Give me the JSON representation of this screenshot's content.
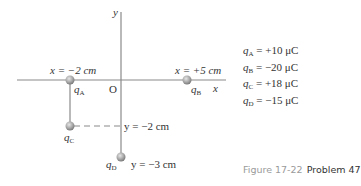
{
  "figure": {
    "caption_figure": "Figure 17-22",
    "caption_problem": "Problem 47"
  },
  "axes": {
    "x_label": "x",
    "y_label": "y",
    "origin_label": "O"
  },
  "points": {
    "qA": {
      "name": "q",
      "sub": "A",
      "position_label": "x = −2 cm"
    },
    "qB": {
      "name": "q",
      "sub": "B",
      "position_label": "x = +5 cm"
    },
    "qC": {
      "name": "q",
      "sub": "C",
      "position_label": "y = −2 cm"
    },
    "qD": {
      "name": "q",
      "sub": "D",
      "position_label": "y = −3 cm"
    }
  },
  "charges": [
    {
      "name": "q",
      "sub": "A",
      "value": " = +10 μC"
    },
    {
      "name": "q",
      "sub": "B",
      "value": " = −20 μC"
    },
    {
      "name": "q",
      "sub": "C",
      "value": " = +18 μC"
    },
    {
      "name": "q",
      "sub": "D",
      "value": " = −15 μC"
    }
  ],
  "colors": {
    "axis": "#8a8a8a",
    "charge_fill": "#a8a8a8",
    "text": "#333333",
    "caption_gray": "#9a9a9a"
  }
}
